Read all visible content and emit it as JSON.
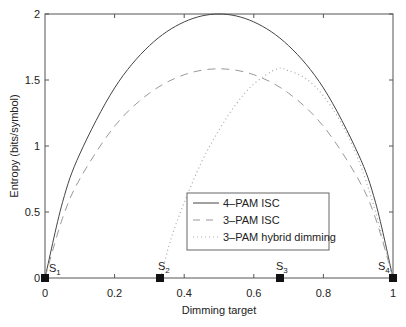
{
  "chart_data": {
    "type": "line",
    "title": "",
    "xlabel": "Dimming target",
    "ylabel": "Entropy (bits/symbol)",
    "xlim": [
      0,
      1
    ],
    "ylim": [
      0,
      2
    ],
    "xticks": [
      "0",
      "0.2",
      "0.4",
      "0.6",
      "0.8",
      "1"
    ],
    "yticks": [
      "0",
      "0.5",
      "1",
      "1.5",
      "2"
    ],
    "grid": false,
    "legend_position": "lower center",
    "series": [
      {
        "name": "4–PAM ISC",
        "style": "solid",
        "x": [
          0,
          0.05,
          0.1,
          0.2,
          0.3,
          0.4,
          0.5,
          0.6,
          0.7,
          0.8,
          0.9,
          0.95,
          1
        ],
        "values": [
          0,
          0.57,
          0.94,
          1.44,
          1.76,
          1.94,
          2.0,
          1.94,
          1.76,
          1.44,
          0.94,
          0.57,
          0
        ]
      },
      {
        "name": "3–PAM ISC",
        "style": "dashed",
        "x": [
          0,
          0.05,
          0.1,
          0.2,
          0.3,
          0.4,
          0.5,
          0.6,
          0.7,
          0.8,
          0.9,
          0.95,
          1
        ],
        "values": [
          0,
          0.45,
          0.75,
          1.15,
          1.4,
          1.54,
          1.585,
          1.54,
          1.4,
          1.15,
          0.75,
          0.45,
          0
        ]
      },
      {
        "name": "3–PAM hybrid dimming",
        "style": "dotted",
        "x": [
          0.333,
          0.36,
          0.4,
          0.45,
          0.5,
          0.55,
          0.6,
          0.667,
          0.7,
          0.75,
          0.8,
          0.85,
          0.9,
          0.95,
          1
        ],
        "values": [
          0,
          0.28,
          0.57,
          0.88,
          1.12,
          1.32,
          1.47,
          1.585,
          1.57,
          1.51,
          1.38,
          1.18,
          0.9,
          0.5,
          0
        ]
      }
    ],
    "markers": [
      {
        "label": "S1",
        "x": 0,
        "y": 0
      },
      {
        "label": "S2",
        "x": 0.333,
        "y": 0
      },
      {
        "label": "S3",
        "x": 0.667,
        "y": 0
      },
      {
        "label": "S4",
        "x": 1,
        "y": 0
      }
    ]
  },
  "labels": {
    "xlabel": "Dimming target",
    "ylabel": "Entropy (bits/symbol)",
    "legend": [
      "4–PAM ISC",
      "3–PAM ISC",
      "3–PAM hybrid dimming"
    ],
    "xticks": [
      "0",
      "0.2",
      "0.4",
      "0.6",
      "0.8",
      "1"
    ],
    "yticks": [
      "0",
      "0.5",
      "1",
      "1.5",
      "2"
    ],
    "markers": [
      "S",
      "S",
      "S",
      "S"
    ],
    "marker_subs": [
      "1",
      "2",
      "3",
      "4"
    ]
  }
}
